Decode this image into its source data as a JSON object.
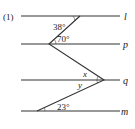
{
  "problem_number": "(1)",
  "lines": [
    {
      "name": "l",
      "y": 16
    },
    {
      "name": "p",
      "y": 44
    },
    {
      "name": "q",
      "y": 80
    },
    {
      "name": "m",
      "y": 111
    }
  ],
  "line_x_start": 21,
  "line_x_end": 120,
  "vertices": {
    "on_l": {
      "x": 80,
      "y": 16
    },
    "on_p": {
      "x": 49,
      "y": 44
    },
    "on_q": {
      "x": 104,
      "y": 80
    },
    "on_m": {
      "x": 37,
      "y": 111
    }
  },
  "angles": [
    {
      "id": "angle-38",
      "label": "38°"
    },
    {
      "id": "angle-70",
      "label": "70°"
    },
    {
      "id": "angle-x",
      "label": "x"
    },
    {
      "id": "angle-y",
      "label": "y"
    },
    {
      "id": "angle-23",
      "label": "23°"
    }
  ],
  "colors": {
    "stroke": "#333333",
    "text": "#222222",
    "background": "#ffffff"
  }
}
